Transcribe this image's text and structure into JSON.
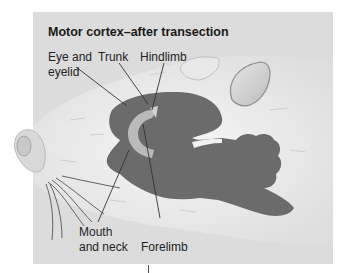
{
  "figure": {
    "title": "Motor cortex–after transection",
    "labels": {
      "eye_and_eyelid_line1": "Eye and",
      "eye_and_eyelid_line2": "eyelid",
      "trunk": "Trunk",
      "hindlimb": "Hindlimb",
      "mouth_and_neck_line1": "Mouth",
      "mouth_and_neck_line2": "and neck",
      "forelimb": "Forelimb"
    },
    "colors": {
      "panel_bg": "#dcdcdc",
      "cortex_map": "#6b6b6b",
      "highlight_region": "#b9b9b9",
      "fur": "#efefef"
    }
  }
}
